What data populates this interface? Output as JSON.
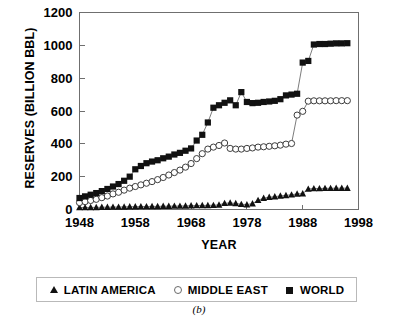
{
  "chart_data": {
    "type": "line",
    "title": "",
    "xlabel": "YEAR",
    "ylabel": "RESERVES (BILLION BBL)",
    "xlim": [
      1948,
      1998
    ],
    "ylim": [
      0,
      1200
    ],
    "xticks": [
      1948,
      1958,
      1968,
      1978,
      1988,
      1998
    ],
    "yticks": [
      0,
      200,
      400,
      600,
      800,
      1000,
      1200
    ],
    "grid": false,
    "legend_position": "below-plot",
    "caption": "(b)",
    "x": [
      1948,
      1949,
      1950,
      1951,
      1952,
      1953,
      1954,
      1955,
      1956,
      1957,
      1958,
      1959,
      1960,
      1961,
      1962,
      1963,
      1964,
      1965,
      1966,
      1967,
      1968,
      1969,
      1970,
      1971,
      1972,
      1973,
      1974,
      1975,
      1976,
      1977,
      1978,
      1979,
      1980,
      1981,
      1982,
      1983,
      1984,
      1985,
      1986,
      1987,
      1988,
      1989,
      1990,
      1991,
      1992,
      1993,
      1994,
      1995,
      1996
    ],
    "series": [
      {
        "name": "LATIN AMERICA",
        "marker": "filled-triangle",
        "color": "#111111",
        "values": [
          12,
          12,
          13,
          13,
          14,
          14,
          15,
          15,
          16,
          17,
          17,
          18,
          18,
          19,
          19,
          20,
          20,
          21,
          21,
          22,
          23,
          24,
          25,
          25,
          26,
          28,
          38,
          40,
          37,
          32,
          30,
          36,
          56,
          69,
          75,
          78,
          83,
          86,
          90,
          95,
          97,
          125,
          128,
          128,
          129,
          129,
          130,
          130,
          130
        ]
      },
      {
        "name": "MIDDLE EAST",
        "marker": "open-circle",
        "color": "#ffffff",
        "values": [
          42,
          48,
          55,
          62,
          72,
          82,
          95,
          105,
          118,
          130,
          140,
          150,
          160,
          170,
          182,
          195,
          210,
          225,
          240,
          258,
          280,
          310,
          340,
          368,
          380,
          390,
          405,
          372,
          368,
          368,
          372,
          375,
          380,
          382,
          385,
          388,
          392,
          398,
          402,
          575,
          598,
          660,
          662,
          662,
          662,
          662,
          663,
          663,
          663
        ]
      },
      {
        "name": "WORLD",
        "marker": "filled-square",
        "color": "#111111",
        "values": [
          70,
          80,
          90,
          100,
          112,
          125,
          140,
          155,
          175,
          200,
          245,
          265,
          282,
          292,
          300,
          312,
          322,
          335,
          345,
          358,
          372,
          420,
          455,
          530,
          620,
          635,
          650,
          665,
          635,
          715,
          655,
          648,
          650,
          655,
          658,
          662,
          672,
          695,
          700,
          705,
          895,
          905,
          1005,
          1008,
          1008,
          1010,
          1012,
          1012,
          1013
        ]
      }
    ]
  },
  "legend": {
    "items": [
      {
        "label": "LATIN AMERICA",
        "marker": "filled-triangle"
      },
      {
        "label": "MIDDLE EAST",
        "marker": "open-circle"
      },
      {
        "label": "WORLD",
        "marker": "filled-square"
      }
    ]
  },
  "figure": {
    "caption": "(b)"
  }
}
